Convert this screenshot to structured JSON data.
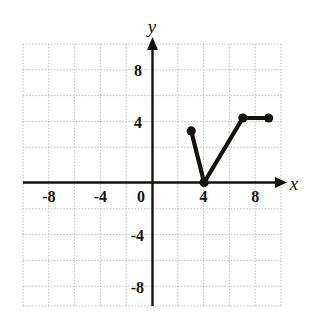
{
  "chart_data": {
    "type": "line",
    "title": "",
    "xlabel": "x",
    "ylabel": "y",
    "xlim": [
      -10,
      10
    ],
    "ylim": [
      -10,
      10
    ],
    "grid": true,
    "grid_step": 2,
    "legend": "none",
    "x_tick_labels": [
      "-8",
      "-4",
      "0",
      "4",
      "8"
    ],
    "x_tick_values": [
      -8,
      -4,
      0,
      4,
      8
    ],
    "y_tick_labels": [
      "8",
      "4",
      "-4",
      "-8"
    ],
    "y_tick_values": [
      8,
      4,
      -4,
      -8
    ],
    "series": [
      {
        "name": "piecewise-graph",
        "x": [
          3,
          4,
          7,
          9
        ],
        "y": [
          4,
          0,
          5,
          5
        ],
        "marker": "filled-circle",
        "endpoints_closed": true
      }
    ],
    "points": [
      {
        "x": 3,
        "y": 4
      },
      {
        "x": 4,
        "y": 0
      },
      {
        "x": 7,
        "y": 5
      },
      {
        "x": 9,
        "y": 5
      }
    ],
    "colors": {
      "curve": "#15120f",
      "axis": "#15120f",
      "grid": "#b9b9b9",
      "background": "#ffffff"
    }
  },
  "axes": {
    "x_label": "x",
    "y_label": "y"
  }
}
